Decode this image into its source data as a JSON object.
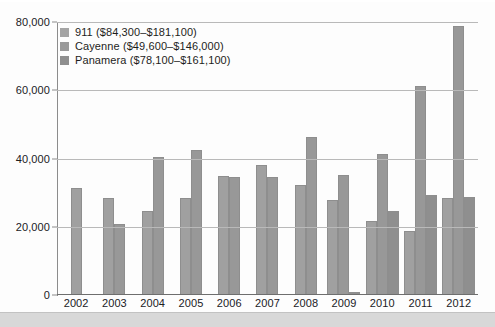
{
  "chart_data": {
    "type": "bar",
    "title": "",
    "subtitle": "",
    "xlabel": "",
    "ylabel": "",
    "categories": [
      "2002",
      "2003",
      "2004",
      "2005",
      "2006",
      "2007",
      "2008",
      "2009",
      "2010",
      "2011",
      "2012"
    ],
    "ylim": [
      0,
      80000
    ],
    "yticks": [
      0,
      20000,
      40000,
      60000,
      80000
    ],
    "ytick_labels": [
      "0",
      "20,000",
      "40,000",
      "60,000",
      "80,000"
    ],
    "grid": true,
    "legend_position": "top-left",
    "series": [
      {
        "name": "911 ($84,300–$181,100)",
        "short_name": "911",
        "price_range": "$84,300–$181,100",
        "color": "#a4a4a4",
        "values": [
          31500,
          28300,
          24500,
          28500,
          35000,
          38000,
          32300,
          27800,
          21800,
          18800,
          28500
        ]
      },
      {
        "name": "Cayenne ($49,600–$146,000)",
        "short_name": "Cayenne",
        "price_range": "$49,600–$146,000",
        "color": "#9a9a9a",
        "values": [
          null,
          20900,
          40500,
          42500,
          34700,
          34700,
          46200,
          35300,
          41200,
          61200,
          78800
        ]
      },
      {
        "name": "Panamera ($78,100–$161,100)",
        "short_name": "Panamera",
        "price_range": "$78,100–$161,100",
        "color": "#8f8f8f",
        "values": [
          null,
          null,
          null,
          null,
          null,
          null,
          null,
          900,
          24600,
          29300,
          28700
        ]
      }
    ]
  },
  "axis": {
    "y_ticks": [
      "80,000",
      "60,000",
      "40,000",
      "20,000",
      "0"
    ],
    "x_ticks": [
      "2002",
      "2003",
      "2004",
      "2005",
      "2006",
      "2007",
      "2008",
      "2009",
      "2010",
      "2011",
      "2012"
    ]
  },
  "legend": {
    "items": [
      {
        "label": "911 ($84,300–$181,100)"
      },
      {
        "label": "Cayenne ($49,600–$146,000)"
      },
      {
        "label": "Panamera ($78,100–$161,100)"
      }
    ]
  },
  "colors": {
    "series_911": "#a4a4a4",
    "series_cayenne": "#9a9a9a",
    "series_panamera": "#8f8f8f",
    "gridline": "#b9b9b9",
    "axis": "#6e6e6e",
    "text": "#20201f",
    "background": "#fdfdfd",
    "bottom_band": "#d8d8d8"
  }
}
